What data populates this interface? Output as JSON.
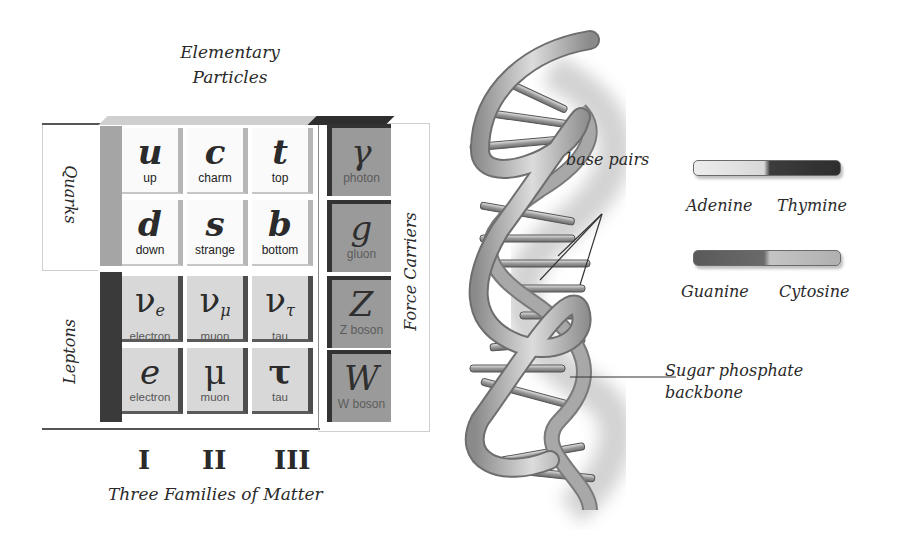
{
  "standard_model": {
    "title_line1": "Elementary",
    "title_line2": "Particles",
    "side_labels": {
      "quarks": "Quarks",
      "leptons": "Leptons",
      "force_carriers": "Force Carriers"
    },
    "quarks": [
      {
        "symbol": "u",
        "name": "up"
      },
      {
        "symbol": "c",
        "name": "charm"
      },
      {
        "symbol": "t",
        "name": "top"
      },
      {
        "symbol": "d",
        "name": "down"
      },
      {
        "symbol": "s",
        "name": "strange"
      },
      {
        "symbol": "b",
        "name": "bottom"
      }
    ],
    "leptons": [
      {
        "symbol": "ν",
        "sub": "e",
        "name1": "electron",
        "name2": "neutrino"
      },
      {
        "symbol": "ν",
        "sub": "μ",
        "name1": "muon",
        "name2": "neutrino"
      },
      {
        "symbol": "ν",
        "sub": "τ",
        "name1": "tau",
        "name2": "neutrino"
      },
      {
        "symbol": "e",
        "name1": "electron"
      },
      {
        "symbol": "μ",
        "name1": "muon"
      },
      {
        "symbol": "τ",
        "name1": "tau"
      }
    ],
    "force_carriers": [
      {
        "symbol": "γ",
        "name": "photon"
      },
      {
        "symbol": "g",
        "name": "gluon"
      },
      {
        "symbol": "Z",
        "name": "Z boson"
      },
      {
        "symbol": "W",
        "name": "W boson"
      }
    ],
    "generations": [
      "I",
      "II",
      "III"
    ],
    "generations_caption": "Three Families of Matter"
  },
  "dna": {
    "base_pairs_label": "base pairs",
    "backbone_label_line1": "Sugar phosphate",
    "backbone_label_line2": "backbone",
    "legend": [
      {
        "left": "Adenine",
        "right": "Thymine",
        "left_color": "#e6e6e6",
        "right_color": "#3c3c3c"
      },
      {
        "left": "Guanine",
        "right": "Cytosine",
        "left_color": "#5e5e5e",
        "right_color": "#bdbdbd"
      }
    ]
  },
  "colors": {
    "quark_cell": "#fafafa",
    "lepton_cell": "#d8d8d8",
    "boson_cell": "#9a9a9a",
    "ribbon": "#b9b9b9"
  }
}
